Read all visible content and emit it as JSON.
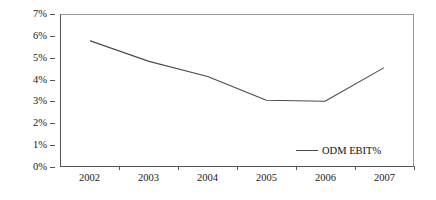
{
  "chart_data": {
    "type": "line",
    "title": "",
    "subtitle": "",
    "xlabel": "",
    "ylabel": "",
    "categories": [
      "2002",
      "2003",
      "2004",
      "2005",
      "2006",
      "2007"
    ],
    "series": [
      {
        "name": "ODM EBIT%",
        "color": "#4c4c4c",
        "values": [
          5.8,
          4.85,
          4.15,
          3.05,
          3.0,
          4.55
        ]
      }
    ],
    "ylim": [
      0,
      7
    ],
    "ytick_values": [
      0,
      1,
      2,
      3,
      4,
      5,
      6,
      7
    ],
    "ytick_labels": [
      "0%",
      "1%",
      "2%",
      "3%",
      "4%",
      "5%",
      "6%",
      "7%"
    ],
    "xtick_labels": [
      "2002",
      "2003",
      "2004",
      "2005",
      "2006",
      "2007"
    ],
    "grid": false,
    "legend": {
      "position": "inside-bottom-right",
      "entries": [
        {
          "label": "ODM EBIT%",
          "color": "#4c4c4c",
          "marker": "line"
        }
      ]
    },
    "axis_color": "#555555",
    "plot_border_color": "#9a9a9a",
    "background": "#ffffff"
  }
}
